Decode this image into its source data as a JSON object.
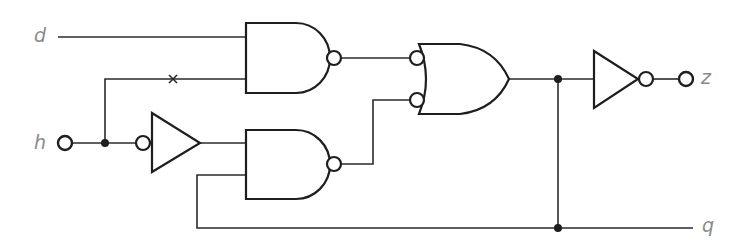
{
  "diagram": {
    "type": "logic-circuit",
    "colors": {
      "line": "#1e1e1e",
      "label": "#8a8a8a",
      "background": "#ffffff"
    },
    "inputs": [
      {
        "id": "d",
        "label": "d"
      },
      {
        "id": "h",
        "label": "h"
      }
    ],
    "outputs": [
      {
        "id": "z",
        "label": "z"
      },
      {
        "id": "q",
        "label": "q"
      }
    ],
    "gates": [
      {
        "id": "nand1",
        "type": "NAND",
        "inputs": [
          "d",
          "h (broken wire, marked x)"
        ],
        "output": "to OR input 1 (inverted)"
      },
      {
        "id": "inv_buffer",
        "type": "buffer with inverted input",
        "inputs": [
          "h"
        ],
        "output": "to NAND2 input 1"
      },
      {
        "id": "nand2",
        "type": "NAND",
        "inputs": [
          "buffer output",
          "q (feedback)"
        ],
        "output": "to OR input 2 (inverted)"
      },
      {
        "id": "or1",
        "type": "OR with inverted inputs",
        "inputs": [
          "nand1",
          "nand2"
        ],
        "output": "node q"
      },
      {
        "id": "not1",
        "type": "NOT",
        "inputs": [
          "q"
        ],
        "output": "z"
      }
    ],
    "annotations": [
      {
        "type": "x-mark",
        "meaning": "wire break on h to NAND1 lower input"
      }
    ]
  }
}
